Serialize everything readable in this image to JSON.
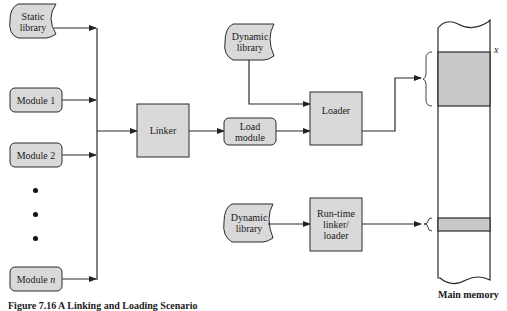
{
  "figure": {
    "caption": "Figure 7.16   A Linking and Loading Scenario",
    "colors": {
      "box_fill": "#d9d9d9",
      "memory_block_fill": "#c8c8c8",
      "stroke": "#2a2a2a",
      "background": "#ffffff"
    }
  },
  "inputs": {
    "static_library": "Static library",
    "module_1": "Module 1",
    "module_2": "Module 2",
    "module_n_prefix": "Module ",
    "module_n_var": "n",
    "ellipsis_dots": 3
  },
  "processes": {
    "linker": "Linker",
    "load_module_line1": "Load",
    "load_module_line2": "module",
    "loader": "Loader",
    "dynamic_library_top_line1": "Dynamic",
    "dynamic_library_top_line2": "library",
    "dynamic_library_bottom_line1": "Dynamic",
    "dynamic_library_bottom_line2": "library",
    "runtime_line1": "Run-time",
    "runtime_line2": "linker/",
    "runtime_line3": "loader"
  },
  "memory": {
    "label": "Main memory",
    "address_marker": "x"
  },
  "edges": [
    {
      "from": "Static library",
      "to": "Linker"
    },
    {
      "from": "Module 1",
      "to": "Linker"
    },
    {
      "from": "Module 2",
      "to": "Linker"
    },
    {
      "from": "Module n",
      "to": "Linker"
    },
    {
      "from": "Linker",
      "to": "Load module"
    },
    {
      "from": "Load module",
      "to": "Loader"
    },
    {
      "from": "Dynamic library",
      "to": "Loader"
    },
    {
      "from": "Loader",
      "to": "Main memory (block at x)"
    },
    {
      "from": "Dynamic library",
      "to": "Run-time linker/loader"
    },
    {
      "from": "Run-time linker/loader",
      "to": "Main memory (lower block)"
    }
  ]
}
